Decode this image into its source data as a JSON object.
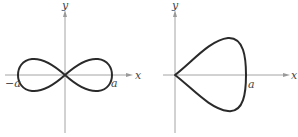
{
  "figures": [
    {
      "name": "lemniscate",
      "axis_labels": {
        "x": "x",
        "y": "y"
      },
      "intercept_labels": {
        "left": "−a",
        "right": "a"
      }
    },
    {
      "name": "teardrop",
      "axis_labels": {
        "x": "x",
        "y": "y"
      },
      "intercept_labels": {
        "right": "a"
      }
    }
  ]
}
